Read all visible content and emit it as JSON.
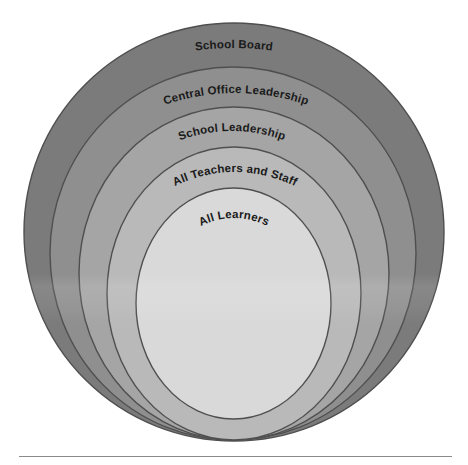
{
  "diagram": {
    "type": "nested-ellipses",
    "rings": [
      {
        "label": "School Board",
        "color": "#7b7b7b"
      },
      {
        "label": "Central Office Leadership",
        "color": "#8f8f8f"
      },
      {
        "label": "School Leadership",
        "color": "#a5a5a5"
      },
      {
        "label": "All Teachers and Staff",
        "color": "#b9b9b9"
      },
      {
        "label": "All Learners",
        "color": "#d9d9d9"
      }
    ],
    "stroke_color": "#4f4f4f",
    "divider_color": "#8a8a8a"
  }
}
